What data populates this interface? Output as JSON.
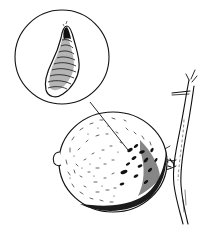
{
  "illustration": {
    "subject": "Citrus fruit on a branch with magnified inset of a scale insect",
    "style": "black pen-and-ink line drawing on white",
    "colors": {
      "background": "#ffffff",
      "ink": "#111111",
      "shade": "#2a2a2a"
    },
    "inset": {
      "label": "magnified scale insect",
      "center": [
        62,
        57
      ],
      "radius": 47
    },
    "leader_line": {
      "from": [
        90,
        102
      ],
      "to": [
        128,
        150
      ]
    },
    "fruit": {
      "label": "citrus fruit",
      "center": [
        113,
        162
      ],
      "rx": 56,
      "ry": 50
    },
    "branch": {
      "label": "twig"
    }
  }
}
